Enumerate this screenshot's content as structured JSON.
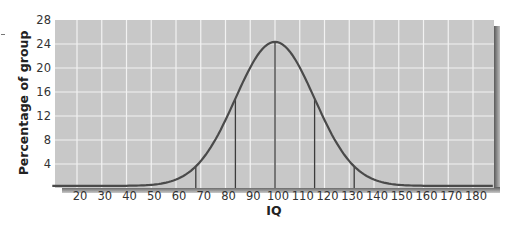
{
  "chart_data": {
    "type": "line",
    "title": "",
    "xlabel": "IQ",
    "ylabel": "Percentage of group",
    "x_ticks": [
      20,
      30,
      40,
      50,
      60,
      70,
      80,
      90,
      100,
      110,
      120,
      130,
      140,
      150,
      160,
      170,
      180
    ],
    "y_ticks": [
      4,
      8,
      12,
      16,
      20,
      24,
      28
    ],
    "xlim": [
      10,
      190
    ],
    "ylim": [
      0,
      28
    ],
    "grid": true,
    "legend": null,
    "series": [
      {
        "name": "IQ distribution (normal curve, mean 100, SD 16)",
        "x": [
          10,
          20,
          30,
          40,
          50,
          60,
          68,
          70,
          80,
          84,
          90,
          100,
          110,
          116,
          120,
          130,
          132,
          140,
          150,
          160,
          170,
          180,
          190
        ],
        "values": [
          0.4,
          0.7,
          1.4,
          2.6,
          4.5,
          7.5,
          10.3,
          11.0,
          16.5,
          19.2,
          22.2,
          24.0,
          22.2,
          19.2,
          16.5,
          11.0,
          10.3,
          7.5,
          4.5,
          2.6,
          1.4,
          0.7,
          0.4
        ]
      }
    ],
    "reference_lines": {
      "orientation": "vertical",
      "x": [
        68,
        84,
        100,
        116,
        132
      ],
      "description": "Vertical lines from baseline to curve at mean and ±1, ±2 standard deviations"
    }
  },
  "labels": {
    "xlabel": "IQ",
    "ylabel": "Percentage of group",
    "x_ticks": [
      "20",
      "30",
      "40",
      "50",
      "60",
      "70",
      "80",
      "90",
      "100",
      "110",
      "120",
      "130",
      "140",
      "150",
      "160",
      "170",
      "180"
    ],
    "y_ticks": [
      "4",
      "8",
      "12",
      "16",
      "20",
      "24",
      "28"
    ]
  },
  "colors": {
    "plot_background": "#c8c8c8",
    "grid": "#f2f2f2",
    "curve": "#4a4a4a",
    "shadow": "#6e6e6e"
  }
}
